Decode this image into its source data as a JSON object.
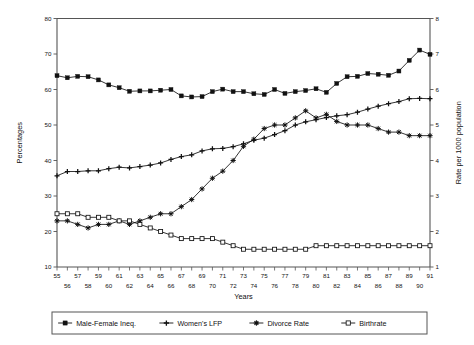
{
  "chart_data": {
    "type": "line",
    "title": "",
    "xlabel": "Years",
    "ylabel": "Percentages",
    "ylabel_right": "Rate per 1000 population",
    "xlim": [
      55,
      91
    ],
    "ylim": [
      10,
      80
    ],
    "ylim_right": [
      1,
      8
    ],
    "grid": false,
    "legend_position": "bottom",
    "ytick_labels": [
      "10",
      "20",
      "30",
      "40",
      "50",
      "60",
      "70",
      "80"
    ],
    "ytick_values": [
      10,
      20,
      30,
      40,
      50,
      60,
      70,
      80
    ],
    "ytick_right_labels": [
      "1",
      "2",
      "3",
      "4",
      "5",
      "6",
      "7",
      "8"
    ],
    "ytick_right_values": [
      1,
      2,
      3,
      4,
      5,
      6,
      7,
      8
    ],
    "xtick_labels_upper": [
      "55",
      "57",
      "59",
      "61",
      "63",
      "65",
      "67",
      "69",
      "71",
      "73",
      "75",
      "77",
      "79",
      "81",
      "83",
      "85",
      "87",
      "89",
      "91"
    ],
    "xtick_labels_lower": [
      "56",
      "58",
      "60",
      "62",
      "64",
      "66",
      "68",
      "70",
      "72",
      "74",
      "76",
      "78",
      "80",
      "82",
      "84",
      "86",
      "88",
      "90"
    ],
    "x": [
      55,
      56,
      57,
      58,
      59,
      60,
      61,
      62,
      63,
      64,
      65,
      66,
      67,
      68,
      69,
      70,
      71,
      72,
      73,
      74,
      75,
      76,
      77,
      78,
      79,
      80,
      81,
      82,
      83,
      84,
      85,
      86,
      87,
      88,
      89,
      90,
      91
    ],
    "series": [
      {
        "name": "Male-Female Ineq.",
        "marker": "filled-square",
        "axis": "left",
        "unit": "percent",
        "values": [
          63.9,
          63.3,
          63.7,
          63.6,
          62.7,
          61.3,
          60.5,
          59.5,
          59.6,
          59.6,
          59.8,
          60.0,
          58.2,
          57.9,
          58.0,
          59.4,
          60.1,
          59.4,
          59.4,
          58.8,
          58.6,
          60.0,
          58.9,
          59.4,
          59.7,
          60.2,
          59.2,
          61.7,
          63.6,
          63.7,
          64.5,
          64.3,
          64.0,
          65.2,
          68.2,
          71.1,
          69.9
        ]
      },
      {
        "name": "Women's LFP",
        "marker": "plus",
        "axis": "left",
        "unit": "percent",
        "values": [
          35.7,
          36.9,
          36.9,
          37.1,
          37.1,
          37.7,
          38.1,
          37.9,
          38.3,
          38.7,
          39.3,
          40.3,
          41.1,
          41.6,
          42.7,
          43.3,
          43.4,
          43.9,
          44.7,
          45.7,
          46.3,
          47.3,
          48.4,
          50.0,
          50.9,
          51.5,
          52.1,
          52.6,
          52.9,
          53.6,
          54.5,
          55.3,
          56.0,
          56.6,
          57.4,
          57.5,
          57.4
        ]
      },
      {
        "name": "Divorce Rate",
        "marker": "asterisk",
        "axis": "right",
        "unit": "per-1000",
        "values": [
          2.3,
          2.3,
          2.2,
          2.1,
          2.2,
          2.2,
          2.3,
          2.2,
          2.3,
          2.4,
          2.5,
          2.5,
          2.7,
          2.9,
          3.2,
          3.5,
          3.7,
          4.0,
          4.4,
          4.6,
          4.9,
          5.0,
          5.0,
          5.2,
          5.4,
          5.2,
          5.3,
          5.1,
          5.0,
          5.0,
          5.0,
          4.9,
          4.8,
          4.8,
          4.7,
          4.7,
          4.7
        ]
      },
      {
        "name": "Birthrate",
        "marker": "open-square",
        "axis": "right",
        "unit": "per-1000",
        "values": [
          2.5,
          2.5,
          2.5,
          2.4,
          2.4,
          2.4,
          2.3,
          2.3,
          2.2,
          2.1,
          2.0,
          1.9,
          1.8,
          1.8,
          1.8,
          1.8,
          1.7,
          1.6,
          1.5,
          1.5,
          1.5,
          1.5,
          1.5,
          1.5,
          1.5,
          1.6,
          1.6,
          1.6,
          1.6,
          1.6,
          1.6,
          1.6,
          1.6,
          1.6,
          1.6,
          1.6,
          1.6
        ]
      }
    ]
  },
  "legend": {
    "items": [
      {
        "label": "Male-Female Ineq.",
        "marker": "filled-square"
      },
      {
        "label": "Women's LFP",
        "marker": "plus"
      },
      {
        "label": "Divorce Rate",
        "marker": "asterisk"
      },
      {
        "label": "Birthrate",
        "marker": "open-square"
      }
    ]
  },
  "axes": {
    "left_title": "Percentages",
    "right_title": "Rate per 1000 population",
    "bottom_title": "Years"
  }
}
